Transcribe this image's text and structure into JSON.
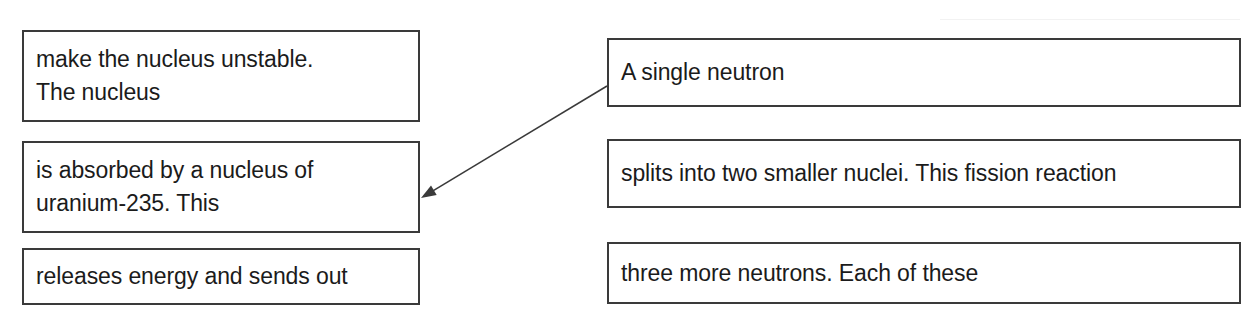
{
  "page": {
    "background_color": "#ffffff",
    "ink_color": "#1b1b1b",
    "box_border_color": "#3a3a3a"
  },
  "left_column": {
    "boxes": [
      {
        "id": "make-nucleus-unstable",
        "text": "make the nucleus unstable.\nThe nucleus",
        "lines": [
          "make the nucleus unstable.",
          "The nucleus"
        ]
      },
      {
        "id": "absorbed-by-nucleus",
        "text": "is absorbed by a nucleus of\nuranium-235. This",
        "lines": [
          "is absorbed by a nucleus of",
          "uranium-235. This"
        ]
      },
      {
        "id": "releases-energy",
        "text": "releases energy and sends out",
        "lines": [
          "releases energy and sends out"
        ]
      }
    ]
  },
  "right_column": {
    "boxes": [
      {
        "id": "single-neutron",
        "text": "A single neutron",
        "lines": [
          "A single neutron"
        ]
      },
      {
        "id": "splits-into-two",
        "text": "splits into two smaller nuclei. This fission reaction",
        "lines": [
          "splits into two smaller nuclei. This fission reaction"
        ]
      },
      {
        "id": "three-more-neutrons",
        "text": "three more neutrons. Each of these",
        "lines": [
          "three more neutrons. Each of these"
        ]
      }
    ]
  },
  "connectors": [
    {
      "id": "arrow-single-neutron-to-absorbed-by-nucleus",
      "from_box": "single-neutron",
      "to_box": "absorbed-by-nucleus",
      "color": "#3a3a3a",
      "start": {
        "x": 607,
        "y": 86
      },
      "end": {
        "x": 421,
        "y": 198
      },
      "has_arrowhead_at_end": true
    }
  ]
}
